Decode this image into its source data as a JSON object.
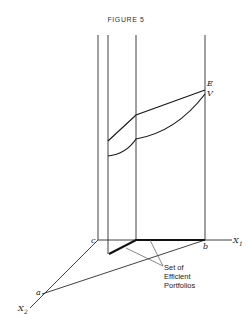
{
  "figure": {
    "title": "FIGURE 5",
    "labels": {
      "E": "E",
      "V": "V",
      "c": "c",
      "b": "b",
      "a": "a",
      "x1_main": "X",
      "x1_sub": "1",
      "x2_main": "X",
      "x2_sub": "2"
    },
    "annotation": {
      "line1": "Set of",
      "line2": "Efficient",
      "line3": "Portfolios"
    }
  }
}
